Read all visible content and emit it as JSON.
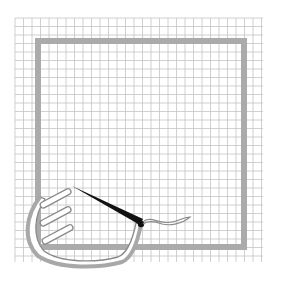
{
  "illustration": {
    "description": "Hand-drawn illustration on grid paper: a hand holding a needle with thread inside a gray square frame",
    "colors": {
      "background": "#ffffff",
      "grid": "#c4c4c4",
      "frame": "#ababab",
      "hand_outline": "#8a8a8a",
      "needle": "#111111",
      "thread": "#8a8a8a"
    },
    "grid": {
      "x_start": 15,
      "y_start": 18,
      "x_end": 263,
      "y_end": 262,
      "spacing": 8.5
    },
    "frame": {
      "x": 38,
      "y": 41,
      "width": 206,
      "height": 206,
      "stroke_width": 6
    }
  }
}
